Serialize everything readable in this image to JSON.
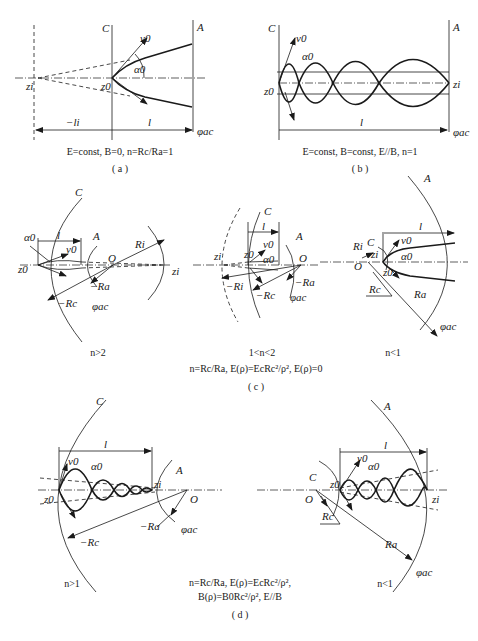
{
  "panels": {
    "a": {
      "caption_label": "( a )",
      "conditions": "E=const, B=0, n=Rc/Ra=1",
      "labels": {
        "cathode": "C",
        "anode": "A",
        "v0": "v0",
        "alpha0": "α0",
        "z0": "z0",
        "zi": "zi",
        "li": "−li",
        "l": "l",
        "phi_ac": "φac"
      }
    },
    "b": {
      "caption_label": "( b )",
      "conditions": "E=const, B=const, E//B, n=1",
      "labels": {
        "cathode": "C",
        "anode": "A",
        "v0": "v0",
        "alpha0": "α0",
        "z0": "z0",
        "zi": "zi",
        "l": "l",
        "phi_ac": "φac"
      }
    },
    "c": {
      "caption_label": "( c )",
      "conditions": "n=Rc/Ra, E(ρ)=EcRc²/ρ², E(ρ)=0",
      "subpanels": [
        {
          "regime": "n>2",
          "labels": {
            "cathode": "C",
            "anode": "A",
            "alpha0": "α0",
            "v0": "v0",
            "l": "l",
            "Ri": "Ri",
            "O": "O",
            "Ra": "−Ra",
            "Rc": "−Rc",
            "z0": "z0",
            "zi": "zi",
            "phi_ac": "φac"
          }
        },
        {
          "regime": "1<n<2",
          "labels": {
            "cathode": "C",
            "anode": "A",
            "v0": "v0",
            "alpha0": "α0",
            "l": "l",
            "O": "O",
            "Ri": "−Ri",
            "Rc": "−Rc",
            "Ra": "−Ra",
            "z0": "z0",
            "zi": "zi",
            "phi_ac": "φac"
          }
        },
        {
          "regime": "n<1",
          "labels": {
            "cathode": "C",
            "anode": "A",
            "v0": "v0",
            "alpha0": "α0",
            "l": "l",
            "O": "O",
            "Ri": "Ri",
            "Rc": "Rc",
            "Ra": "Ra",
            "z0": "z0",
            "zi": "zi",
            "phi_ac": "φac"
          }
        }
      ]
    },
    "d": {
      "caption_label": "( d )",
      "conditions_line1": "n=Rc/Ra, E(ρ)=EcRc²/ρ²,",
      "conditions_line2": "B(ρ)=B0Rc²/ρ², E//B",
      "subpanels": [
        {
          "regime": "n>1",
          "labels": {
            "cathode": "C",
            "anode": "A",
            "v0": "v0",
            "alpha0": "α0",
            "l": "l",
            "O": "O",
            "Ra": "−Ra",
            "Rc": "−Rc",
            "z0": "z0",
            "zi": "zi",
            "phi_ac": "φac"
          }
        },
        {
          "regime": "n<1",
          "labels": {
            "cathode": "C",
            "anode": "A",
            "v0": "v0",
            "alpha0": "α0",
            "l": "l",
            "O": "O",
            "Rc": "Rc",
            "Ra": "Ra",
            "z0": "z0",
            "zi": "zi",
            "phi_ac": "φac"
          }
        }
      ]
    }
  }
}
